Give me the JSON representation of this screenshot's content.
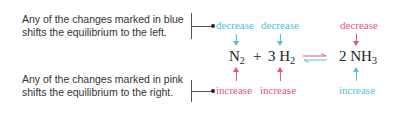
{
  "notes": {
    "blue_line1": "Any of the changes marked in blue",
    "blue_line2": "shifts the equilibrium to the left.",
    "pink_line1": "Any of the changes marked in pink",
    "pink_line2": "shifts the equilibrium to the right."
  },
  "equation": {
    "reactant1": "N",
    "reactant1_sub": "2",
    "plus": "+",
    "reactant2_coef": "3 H",
    "reactant2_sub": "2",
    "product_coef": "2 NH",
    "product_sub": "3"
  },
  "labels": {
    "top": [
      "decrease",
      "decrease",
      "decrease"
    ],
    "bottom": [
      "increase",
      "increase",
      "increase"
    ]
  },
  "colors": {
    "blue": "#4fc3dd",
    "pink": "#e8528a"
  }
}
